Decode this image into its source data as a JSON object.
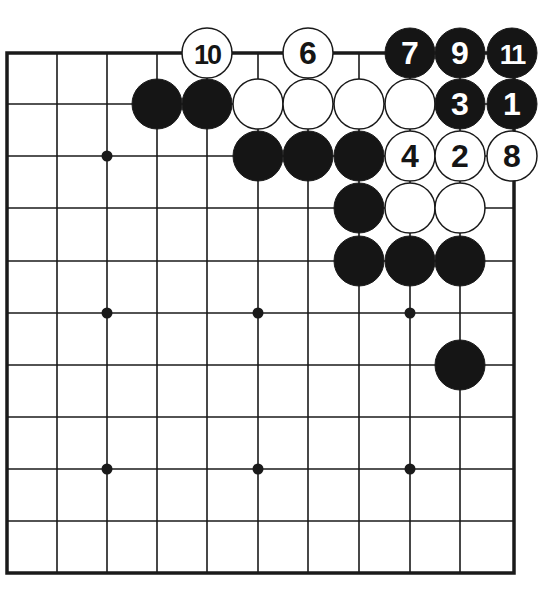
{
  "diagram": {
    "type": "go-board-problem",
    "colors": {
      "background": "#ffffff",
      "line": "#1a1a1a",
      "black_stone": "#151515",
      "white_stone": "#ffffff",
      "black_label": "#ffffff",
      "white_label": "#151515"
    },
    "grid": {
      "x": [
        7,
        57,
        107,
        157,
        207,
        258,
        308,
        359,
        410,
        460,
        512
      ],
      "y": [
        53,
        104,
        156,
        208,
        261,
        313,
        365,
        417,
        469,
        521,
        573
      ],
      "frame": {
        "left": 7,
        "top": 53,
        "right": 514,
        "bottom": 573
      }
    },
    "stone_radius": 25,
    "star_points": [
      {
        "col": 2,
        "row": 2
      },
      {
        "col": 2,
        "row": 5
      },
      {
        "col": 5,
        "row": 5
      },
      {
        "col": 8,
        "row": 5
      },
      {
        "col": 2,
        "row": 8
      },
      {
        "col": 5,
        "row": 8
      },
      {
        "col": 8,
        "row": 8
      }
    ],
    "stones": [
      {
        "color": "white",
        "col": 4,
        "row": 0,
        "label": "10"
      },
      {
        "color": "white",
        "col": 6,
        "row": 0,
        "label": "6"
      },
      {
        "color": "black",
        "col": 8,
        "row": 0,
        "label": "7"
      },
      {
        "color": "black",
        "col": 9,
        "row": 0,
        "label": "9"
      },
      {
        "color": "black",
        "col": 10,
        "row": 0,
        "label": "11"
      },
      {
        "color": "black",
        "col": 3,
        "row": 1,
        "label": ""
      },
      {
        "color": "black",
        "col": 4,
        "row": 1,
        "label": ""
      },
      {
        "color": "white",
        "col": 5,
        "row": 1,
        "label": ""
      },
      {
        "color": "white",
        "col": 6,
        "row": 1,
        "label": ""
      },
      {
        "color": "white",
        "col": 7,
        "row": 1,
        "label": ""
      },
      {
        "color": "white",
        "col": 8,
        "row": 1,
        "label": ""
      },
      {
        "color": "black",
        "col": 9,
        "row": 1,
        "label": "3"
      },
      {
        "color": "black",
        "col": 10,
        "row": 1,
        "label": "1"
      },
      {
        "color": "black",
        "col": 5,
        "row": 2,
        "label": ""
      },
      {
        "color": "black",
        "col": 6,
        "row": 2,
        "label": ""
      },
      {
        "color": "black",
        "col": 7,
        "row": 2,
        "label": ""
      },
      {
        "color": "white",
        "col": 8,
        "row": 2,
        "label": "4"
      },
      {
        "color": "white",
        "col": 9,
        "row": 2,
        "label": "2"
      },
      {
        "color": "white",
        "col": 10,
        "row": 2,
        "label": "8"
      },
      {
        "color": "black",
        "col": 7,
        "row": 3,
        "label": ""
      },
      {
        "color": "white",
        "col": 8,
        "row": 3,
        "label": ""
      },
      {
        "color": "white",
        "col": 9,
        "row": 3,
        "label": ""
      },
      {
        "color": "black",
        "col": 7,
        "row": 4,
        "label": ""
      },
      {
        "color": "black",
        "col": 8,
        "row": 4,
        "label": ""
      },
      {
        "color": "black",
        "col": 9,
        "row": 4,
        "label": ""
      },
      {
        "color": "black",
        "col": 9,
        "row": 6,
        "label": ""
      }
    ]
  }
}
